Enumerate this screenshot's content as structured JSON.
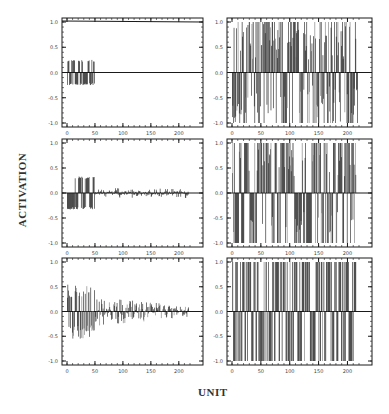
{
  "figure": {
    "ylabel": "ACTIVATION",
    "xlabel": "UNIT",
    "xticks": [
      "0",
      "50",
      "100",
      "150",
      "200"
    ],
    "yticks": [
      "1.0",
      "0.5",
      "0.0",
      "-0.5",
      "-1.0"
    ],
    "ink": "#1a1a1a"
  },
  "chart_data": [
    {
      "type": "bar",
      "panel": "top-left",
      "xlabel": "UNIT",
      "ylabel": "ACTIVATION",
      "xlim": [
        0,
        220
      ],
      "ylim": [
        -1.05,
        1.05
      ],
      "description": "Units 0-50 alternate between about +0.25 and -0.25; units 50-220 are 0. A line near 1.0 spans the top.",
      "active_range": [
        0,
        50
      ],
      "amplitude": 0.25,
      "tail_amplitude": 0.0
    },
    {
      "type": "bar",
      "panel": "top-right",
      "xlabel": "UNIT",
      "ylabel": "ACTIVATION",
      "xlim": [
        0,
        220
      ],
      "ylim": [
        -1.05,
        1.05
      ],
      "description": "Dense bars across units 0-220 ranging from -1.0 to +1.0, many reaching ±1.0.",
      "active_range": [
        0,
        220
      ],
      "amplitude": 1.0,
      "tail_amplitude": 1.0
    },
    {
      "type": "bar",
      "panel": "middle-left",
      "xlabel": "UNIT",
      "ylabel": "ACTIVATION",
      "xlim": [
        0,
        220
      ],
      "ylim": [
        -1.05,
        1.05
      ],
      "description": "Units 0-50 alternate between about +0.3 and -0.35; units 50-220 small noise within ±0.1.",
      "active_range": [
        0,
        50
      ],
      "amplitude": 0.33,
      "tail_amplitude": 0.1
    },
    {
      "type": "bar",
      "panel": "middle-right",
      "xlabel": "UNIT",
      "ylabel": "ACTIVATION",
      "xlim": [
        0,
        220
      ],
      "ylim": [
        -1.05,
        1.05
      ],
      "description": "Mostly saturated bars at +1.0 or -1.0 across units 0-215, a few intermediate values.",
      "active_range": [
        0,
        215
      ],
      "amplitude": 1.0,
      "tail_amplitude": 1.0
    },
    {
      "type": "bar",
      "panel": "bottom-left",
      "xlabel": "UNIT",
      "ylabel": "ACTIVATION",
      "xlim": [
        0,
        220
      ],
      "ylim": [
        -1.05,
        1.05
      ],
      "description": "Units 0-50 range roughly from -0.6 to +0.55; units 50-220 decaying noise within about ±0.35.",
      "active_range": [
        0,
        50
      ],
      "amplitude": 0.55,
      "tail_amplitude": 0.3
    },
    {
      "type": "bar",
      "panel": "bottom-right",
      "xlabel": "UNIT",
      "ylabel": "ACTIVATION",
      "xlim": [
        0,
        220
      ],
      "ylim": [
        -1.05,
        1.05
      ],
      "description": "Fully saturated binary bars at +1.0 or -1.0 across units 0-215.",
      "active_range": [
        0,
        215
      ],
      "amplitude": 1.0,
      "tail_amplitude": 1.0
    }
  ],
  "panels": [
    {
      "id": "top-left",
      "x": 62,
      "y": 18,
      "w": 141,
      "h": 109,
      "mode": "pattern",
      "amp": 0.25,
      "tail": 0.0,
      "seed": 11,
      "topline": true
    },
    {
      "id": "top-right",
      "x": 227,
      "y": 18,
      "w": 145,
      "h": 109,
      "mode": "dense",
      "amp": 1.0,
      "tail": 1.0,
      "seed": 23
    },
    {
      "id": "middle-left",
      "x": 62,
      "y": 139,
      "w": 141,
      "h": 108,
      "mode": "pattern",
      "amp": 0.33,
      "tail": 0.1,
      "seed": 37
    },
    {
      "id": "middle-right",
      "x": 227,
      "y": 139,
      "w": 145,
      "h": 108,
      "mode": "sat",
      "amp": 1.0,
      "tail": 1.0,
      "seed": 41
    },
    {
      "id": "bottom-left",
      "x": 62,
      "y": 258,
      "w": 141,
      "h": 107,
      "mode": "decay",
      "amp": 0.55,
      "tail": 0.3,
      "seed": 53
    },
    {
      "id": "bottom-right",
      "x": 227,
      "y": 258,
      "w": 145,
      "h": 107,
      "mode": "binary",
      "amp": 1.0,
      "tail": 1.0,
      "seed": 67
    }
  ]
}
